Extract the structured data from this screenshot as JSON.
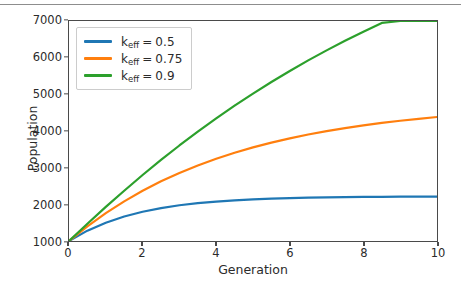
{
  "chart_data": {
    "type": "line",
    "title": "",
    "xlabel": "Generation",
    "ylabel": "Population",
    "xlim": [
      0,
      10
    ],
    "ylim": [
      1000,
      7000
    ],
    "xticks": [
      "0",
      "2",
      "4",
      "6",
      "8",
      "10"
    ],
    "xtick_values": [
      0,
      2,
      4,
      6,
      8,
      10
    ],
    "yticks": [
      "1000",
      "2000",
      "3000",
      "4000",
      "5000",
      "6000",
      "7000"
    ],
    "ytick_values": [
      1000,
      2000,
      3000,
      4000,
      5000,
      6000,
      7000
    ],
    "grid": false,
    "legend_position": "upper left",
    "x": [
      0,
      0.5,
      1,
      1.5,
      2,
      2.5,
      3,
      3.5,
      4,
      4.5,
      5,
      5.5,
      6,
      6.5,
      7,
      7.5,
      8,
      8.5,
      9,
      9.5,
      10
    ],
    "series": [
      {
        "name": "k_eff = 0.5",
        "label_base": "k",
        "label_sub": "eff",
        "label_value": "0.5",
        "color": "#1f77b4",
        "values": [
          1000,
          1282,
          1500,
          1669,
          1799,
          1898,
          1974,
          2032,
          2076,
          2110,
          2135,
          2155,
          2170,
          2181,
          2190,
          2196,
          2201,
          2205,
          2208,
          2210,
          2212
        ]
      },
      {
        "name": "k_eff = 0.75",
        "label_base": "k",
        "label_sub": "eff",
        "label_value": "0.75",
        "color": "#ff7f0e",
        "values": [
          1000,
          1400,
          1760,
          2082,
          2370,
          2627,
          2856,
          3061,
          3244,
          3407,
          3553,
          3683,
          3800,
          3904,
          3997,
          4080,
          4154,
          4221,
          4280,
          4333,
          4381
        ]
      },
      {
        "name": "k_eff = 0.9",
        "label_base": "k",
        "label_sub": "eff",
        "label_value": "0.9",
        "color": "#2ca02c",
        "values": [
          1000,
          1470,
          1930,
          2372,
          2800,
          3210,
          3605,
          3982,
          4344,
          4690,
          5020,
          5336,
          5637,
          5925,
          6199,
          6460,
          6709,
          6947,
          7173,
          7389,
          7595
        ]
      }
    ]
  },
  "figure": {
    "background_color": "#ffffff",
    "axis_color": "#4a4a4a",
    "text_color": "#2b2b2b"
  }
}
